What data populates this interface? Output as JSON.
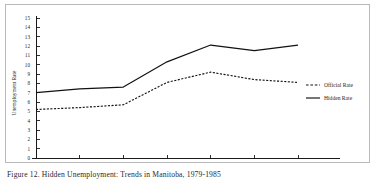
{
  "figure": {
    "caption": "Figure 12. Hidden Unemployment: Trends in Manitoba, 1979-1985"
  },
  "chart_data": {
    "type": "line",
    "title": "",
    "xlabel": "",
    "ylabel": "Unemployment Rate",
    "x": [
      "1979",
      "1980",
      "1981",
      "1982",
      "1983",
      "1984",
      "1985"
    ],
    "xtick_labels": [
      "1979",
      "1980",
      "1981",
      "1982",
      "1983",
      "1984",
      "1985"
    ],
    "ytick_labels": [
      "0",
      "1",
      "2",
      "3",
      "4",
      "5",
      "6",
      "7",
      "8",
      "9",
      "10",
      "11",
      "12",
      "13",
      "14",
      "15"
    ],
    "ylim": [
      0,
      15
    ],
    "grid": false,
    "legend_position": "right",
    "series": [
      {
        "name": "Official Rate",
        "style": "dashed",
        "color": "#111111",
        "values": [
          5.2,
          5.4,
          5.7,
          8.1,
          9.2,
          8.4,
          8.1
        ]
      },
      {
        "name": "Hidden Rate",
        "style": "solid",
        "color": "#111111",
        "values": [
          7.0,
          7.4,
          7.6,
          10.3,
          12.1,
          11.5,
          12.1
        ]
      }
    ]
  }
}
